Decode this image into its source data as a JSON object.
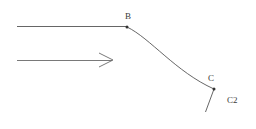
{
  "figure": {
    "title": "",
    "background_color": "#ffffff",
    "stroke_color": "#555555",
    "label_color": "#3a3a3a",
    "width": 256,
    "height": 129
  },
  "labels": {
    "b": "B",
    "c": "C",
    "c2": "C2"
  },
  "geometry": {
    "incoming_line": {
      "name": "horizontal-incoming-line",
      "x1": 17,
      "y1": 26.5,
      "x2": 127,
      "y2": 26.5
    },
    "curve": {
      "name": "curve-b-to-c",
      "start_x": 127,
      "start_y": 27,
      "control1_x": 150,
      "control1_y": 38,
      "control2_x": 176,
      "control2_y": 72,
      "end_x": 214,
      "end_y": 89
    },
    "tail_segment": {
      "name": "segment-c-to-c2",
      "x1": 214,
      "y1": 89,
      "x2": 205.5,
      "y2": 112
    },
    "flow_arrow": {
      "name": "flow-direction-arrow",
      "x1": 17,
      "y1": 60,
      "x2": 112,
      "y2": 60,
      "head_x": 112,
      "head_y": 60,
      "head_back_upper_x": 99,
      "head_back_upper_y": 53,
      "head_back_lower_x": 99,
      "head_back_lower_y": 67
    },
    "point_b": {
      "name": "point-b-marker",
      "cx": 127,
      "cy": 27,
      "r": 1.5
    },
    "point_c": {
      "name": "point-c-marker",
      "cx": 214,
      "cy": 89,
      "r": 1.5
    }
  },
  "icons": {
    "arrow": "right-arrow-icon",
    "node": "point-marker-icon"
  }
}
